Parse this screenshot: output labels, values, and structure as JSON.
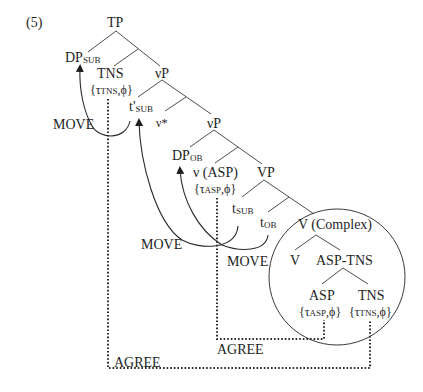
{
  "example_number": "(5)",
  "nodes": {
    "tp": "TP",
    "dp_sub": {
      "base": "DP",
      "sub": "SUB"
    },
    "tns": "TNS",
    "tns_features": {
      "open": "{",
      "tau": "τ",
      "tau_sub": "TNS",
      "rest": ",ϕ}"
    },
    "vp1": "νP",
    "t_prime_sub": {
      "base": "t'",
      "sub": "SUB"
    },
    "v_star": "ν*",
    "vp2": "νP",
    "dp_ob": {
      "base": "DP",
      "sub": "OB"
    },
    "v_asp": "ν (ASP)",
    "asp_features_1": {
      "open": "{",
      "tau": "τ",
      "tau_sub": "ASP",
      "rest": ",ϕ}"
    },
    "vp3": "VP",
    "t_sub": {
      "base": "t",
      "sub": "SUB"
    },
    "t_ob": {
      "base": "t",
      "sub": "OB"
    },
    "v_complex": "V (Complex)",
    "v": "V",
    "asp_tns": "ASP-TNS",
    "asp": "ASP",
    "asp_features_2": {
      "open": "{",
      "tau": "τ",
      "tau_sub": "ASP",
      "rest": ",ϕ}"
    },
    "tns2": "TNS",
    "tns_features_2": {
      "open": "{",
      "tau": "τ",
      "tau_sub": "TNS",
      "rest": ",ϕ}"
    }
  },
  "operations": {
    "move_1": "MOVE",
    "move_2": "MOVE",
    "move_3": "MOVE",
    "agree_1": "AGREE",
    "agree_2": "AGREE"
  },
  "colors": {
    "ink": "#1e1e1e",
    "background": "#ffffff"
  }
}
